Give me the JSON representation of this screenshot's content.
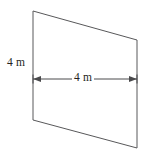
{
  "figure": {
    "type": "parallelogram",
    "background_color": "#ffffff",
    "outline_color": "#58585a",
    "dimension_color": "#4a4a4c",
    "label_color": "#231f20",
    "vertices": [
      {
        "name": "top-left",
        "x": 33,
        "y": 11
      },
      {
        "name": "top-right",
        "x": 137,
        "y": 40
      },
      {
        "name": "bottom-right",
        "x": 137,
        "y": 148
      },
      {
        "name": "bottom-left",
        "x": 33,
        "y": 120
      }
    ],
    "labels": {
      "side_length": "4 m",
      "base_length": "4 m"
    },
    "dimension_arrow": {
      "name": "base-width-arrow",
      "x_start": 33,
      "x_end": 137,
      "y": 79,
      "double_headed": true
    }
  }
}
